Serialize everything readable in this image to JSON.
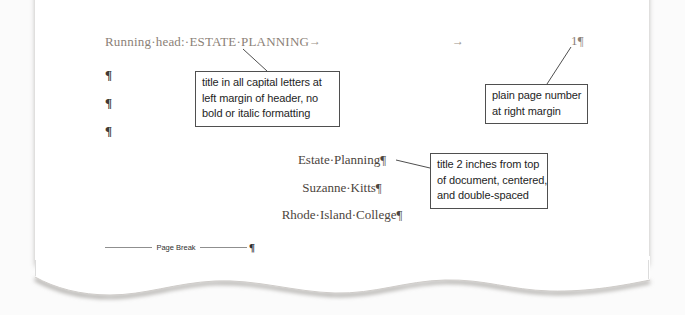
{
  "document": {
    "header": {
      "running_head": "Running·head:·ESTATE·PLANNING",
      "tab_mark_1": "→",
      "tab_mark_2": "→",
      "page_number": "1¶"
    },
    "body": {
      "empty_paragraph_marks": [
        "¶",
        "¶",
        "¶"
      ],
      "title": "Estate·Planning¶",
      "author": "Suzanne·Kitts¶",
      "affiliation": "Rhode·Island·College¶"
    },
    "page_break": {
      "label": "Page Break",
      "paragraph_mark": "¶"
    }
  },
  "annotations": {
    "header_title_callout": {
      "lines": [
        "title in all capital letters at",
        "left margin of header, no",
        "bold or italic formatting"
      ]
    },
    "page_number_callout": {
      "lines": [
        "plain page number",
        "at right margin"
      ]
    },
    "title_position_callout": {
      "lines": [
        "title 2 inches from top",
        "of document, centered,",
        "and double-spaced"
      ]
    }
  },
  "colors": {
    "header_text": "#8b8177",
    "body_text": "#4c453d",
    "callout_border": "#4f4f4f",
    "callout_text": "#1e1e1e",
    "connector_line": "#4f4f4f",
    "page_background": "#ffffff",
    "canvas_background": "#fbfbfb"
  }
}
